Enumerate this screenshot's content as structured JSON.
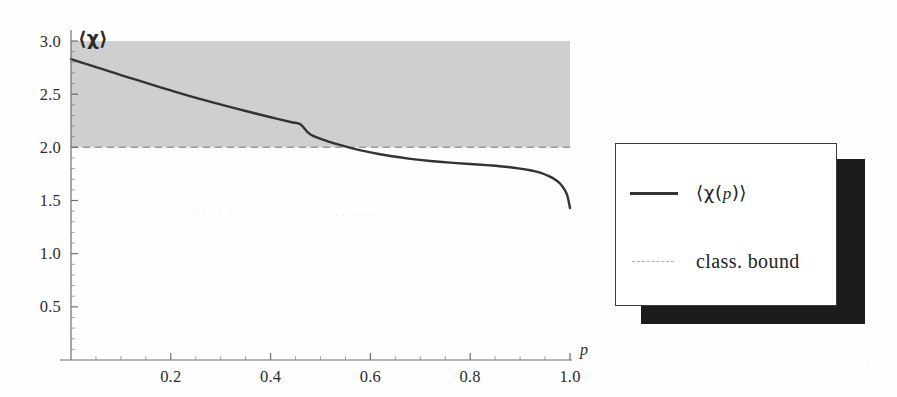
{
  "figure": {
    "y_axis_label": "⟨χ⟩",
    "x_axis_label": "p"
  },
  "legend": {
    "entries": [
      {
        "label_prefix": "⟨χ(",
        "label_var": "p",
        "label_suffix": ")⟩",
        "style": "solid",
        "color": "#333333",
        "swatch_name": "solid-line-swatch"
      },
      {
        "label": "class. bound",
        "style": "dashed",
        "color": "#aeaeae",
        "swatch_name": "dashed-line-swatch"
      }
    ]
  },
  "colors": {
    "curve": "#333333",
    "bound": "#9a9a9a",
    "shaded_band": "#cfcfcf",
    "axis": "#6f6f6f",
    "text": "#2b2b2b",
    "legend_shadow": "#1c1c1c",
    "legend_border": "#3a3a3a",
    "page_background": "#fefefe"
  },
  "chart_data": {
    "type": "line",
    "title": "",
    "subtitle": "",
    "xlabel": "p",
    "ylabel": "⟨χ⟩",
    "xlim": [
      0.0,
      1.04
    ],
    "ylim": [
      0.0,
      3.02
    ],
    "xticks": [
      0.2,
      0.4,
      0.6,
      0.8,
      1.0
    ],
    "xtick_labels": [
      "0.2",
      "0.4",
      "0.6",
      "0.8",
      "1.0"
    ],
    "yticks": [
      0.5,
      1.0,
      1.5,
      2.0,
      2.5,
      3.0
    ],
    "ytick_labels": [
      "0.5",
      "1.0",
      "1.5",
      "2.0",
      "2.5",
      "3.0"
    ],
    "minor_xtick_step": 0.05,
    "minor_ytick_step": 0.1,
    "grid": false,
    "legend_position": "right-outside",
    "series": [
      {
        "name": "⟨χ(p)⟩",
        "style": "solid",
        "color": "#333333",
        "x": [
          0.0,
          0.02,
          0.05,
          0.08,
          0.1,
          0.13,
          0.16,
          0.2,
          0.24,
          0.28,
          0.32,
          0.36,
          0.4,
          0.44,
          0.46,
          0.48,
          0.52,
          0.56,
          0.6,
          0.64,
          0.68,
          0.72,
          0.76,
          0.8,
          0.84,
          0.87,
          0.9,
          0.92,
          0.94,
          0.96,
          0.97,
          0.98,
          0.99,
          0.995,
          1.0
        ],
        "y": [
          2.83,
          2.8,
          2.755,
          2.71,
          2.68,
          2.636,
          2.592,
          2.535,
          2.48,
          2.428,
          2.378,
          2.33,
          2.283,
          2.238,
          2.216,
          2.12,
          2.048,
          1.995,
          1.952,
          1.918,
          1.892,
          1.872,
          1.856,
          1.843,
          1.83,
          1.818,
          1.8,
          1.784,
          1.762,
          1.724,
          1.697,
          1.66,
          1.596,
          1.54,
          1.43
        ]
      },
      {
        "name": "class. bound",
        "style": "dashed",
        "color": "#9a9a9a",
        "constant_y": 2.0,
        "x": [
          0.0,
          1.0
        ],
        "y": [
          2.0,
          2.0
        ]
      }
    ],
    "shaded_regions": [
      {
        "name": "quantum-violation-band",
        "y_from": 2.0,
        "y_to": 3.0,
        "x_from": 0.0,
        "x_to": 1.0,
        "color": "#cfcfcf"
      }
    ],
    "annotations": []
  }
}
